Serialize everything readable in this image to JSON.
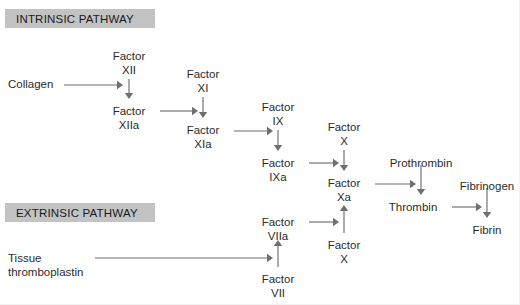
{
  "diagram": {
    "headers": [
      {
        "id": "intrinsic",
        "label": "INTRINSIC PATHWAY",
        "x": 5,
        "y": 9,
        "w": 150,
        "h": 19
      },
      {
        "id": "extrinsic",
        "label": "EXTRINSIC PATHWAY",
        "x": 5,
        "y": 203,
        "w": 150,
        "h": 19
      }
    ],
    "nodes": [
      {
        "id": "collagen",
        "lines": [
          "Collagen"
        ],
        "x": 8,
        "y": 78,
        "align": "left"
      },
      {
        "id": "factor-xii",
        "lines": [
          "Factor",
          "XII"
        ],
        "x": 129,
        "y": 50,
        "align": "center"
      },
      {
        "id": "factor-xiia",
        "lines": [
          "Factor",
          "XIIa"
        ],
        "x": 129,
        "y": 105,
        "align": "center"
      },
      {
        "id": "factor-xi",
        "lines": [
          "Factor",
          "XI"
        ],
        "x": 203,
        "y": 68,
        "align": "center"
      },
      {
        "id": "factor-xia",
        "lines": [
          "Factor",
          "XIa"
        ],
        "x": 203,
        "y": 124,
        "align": "center"
      },
      {
        "id": "factor-ix",
        "lines": [
          "Factor",
          "IX"
        ],
        "x": 278,
        "y": 101,
        "align": "center"
      },
      {
        "id": "factor-ixa",
        "lines": [
          "Factor",
          "IXa"
        ],
        "x": 278,
        "y": 157,
        "align": "center"
      },
      {
        "id": "factor-x-upper",
        "lines": [
          "Factor",
          "X"
        ],
        "x": 344,
        "y": 121,
        "align": "center"
      },
      {
        "id": "factor-xa",
        "lines": [
          "Factor",
          "Xa"
        ],
        "x": 344,
        "y": 177,
        "align": "center"
      },
      {
        "id": "factor-x-lower",
        "lines": [
          "Factor",
          "X"
        ],
        "x": 344,
        "y": 239,
        "align": "center"
      },
      {
        "id": "prothrombin",
        "lines": [
          "Prothrombin"
        ],
        "x": 421,
        "y": 157,
        "align": "center"
      },
      {
        "id": "thrombin",
        "lines": [
          "Thrombin"
        ],
        "x": 413,
        "y": 201,
        "align": "center"
      },
      {
        "id": "fibrinogen",
        "lines": [
          "Fibrinogen"
        ],
        "x": 487,
        "y": 180,
        "align": "center"
      },
      {
        "id": "fibrin",
        "lines": [
          "Fibrin"
        ],
        "x": 487,
        "y": 224,
        "align": "center"
      },
      {
        "id": "factor-viia",
        "lines": [
          "Factor",
          "VIIa"
        ],
        "x": 278,
        "y": 216,
        "align": "center"
      },
      {
        "id": "factor-vii",
        "lines": [
          "Factor",
          "VII"
        ],
        "x": 278,
        "y": 273,
        "align": "center"
      },
      {
        "id": "tissue-thromboplastin",
        "lines": [
          "Tissue",
          "thromboplastin"
        ],
        "x": 8,
        "y": 252,
        "align": "left"
      }
    ],
    "arrows": [
      {
        "id": "collagen-to-factor-xii",
        "from": "collagen",
        "to": "factor-xii",
        "direction": "right",
        "x1": 64,
        "y1": 85,
        "x2": 123,
        "y2": 85
      },
      {
        "id": "factor-xii-to-factor-xiia",
        "from": "factor-xii",
        "to": "factor-xiia",
        "direction": "down",
        "x1": 129,
        "y1": 79,
        "x2": 129,
        "y2": 99
      },
      {
        "id": "factor-xiia-to-factor-xi",
        "from": "factor-xiia",
        "to": "factor-xi",
        "direction": "right",
        "x1": 160,
        "y1": 111,
        "x2": 198,
        "y2": 111
      },
      {
        "id": "factor-xi-to-factor-xia",
        "from": "factor-xi",
        "to": "factor-xia",
        "direction": "down",
        "x1": 203,
        "y1": 97,
        "x2": 203,
        "y2": 118
      },
      {
        "id": "factor-xia-to-factor-ix",
        "from": "factor-xia",
        "to": "factor-ix",
        "direction": "right",
        "x1": 234,
        "y1": 131,
        "x2": 273,
        "y2": 131
      },
      {
        "id": "factor-ix-to-factor-ixa",
        "from": "factor-ix",
        "to": "factor-ixa",
        "direction": "down",
        "x1": 278,
        "y1": 130,
        "x2": 278,
        "y2": 151
      },
      {
        "id": "factor-ixa-to-factor-x-upper",
        "from": "factor-ixa",
        "to": "factor-x-upper",
        "direction": "right",
        "x1": 309,
        "y1": 163,
        "x2": 339,
        "y2": 163
      },
      {
        "id": "factor-x-upper-to-factor-xa",
        "from": "factor-x-upper",
        "to": "factor-xa",
        "direction": "down",
        "x1": 344,
        "y1": 150,
        "x2": 344,
        "y2": 171
      },
      {
        "id": "factor-x-lower-to-factor-xa",
        "from": "factor-x-lower",
        "to": "factor-xa",
        "direction": "up",
        "x1": 344,
        "y1": 233,
        "x2": 344,
        "y2": 205
      },
      {
        "id": "factor-xa-to-prothrombin",
        "from": "factor-xa",
        "to": "prothrombin",
        "direction": "right",
        "x1": 375,
        "y1": 184,
        "x2": 416,
        "y2": 184
      },
      {
        "id": "prothrombin-to-thrombin",
        "from": "prothrombin",
        "to": "thrombin",
        "direction": "down",
        "x1": 421,
        "y1": 165,
        "x2": 421,
        "y2": 195
      },
      {
        "id": "thrombin-to-fibrinogen",
        "from": "thrombin",
        "to": "fibrinogen",
        "direction": "right",
        "x1": 452,
        "y1": 207,
        "x2": 482,
        "y2": 207
      },
      {
        "id": "fibrinogen-to-fibrin",
        "from": "fibrinogen",
        "to": "fibrin",
        "direction": "down",
        "x1": 487,
        "y1": 188,
        "x2": 487,
        "y2": 218
      },
      {
        "id": "factor-vii-to-factor-viia",
        "from": "factor-vii",
        "to": "factor-viia",
        "direction": "up",
        "x1": 278,
        "y1": 267,
        "x2": 278,
        "y2": 240
      },
      {
        "id": "tissue-thromboplastin-to-factor-viia",
        "from": "tissue-thromboplastin",
        "to": "factor-viia",
        "direction": "right",
        "x1": 95,
        "y1": 258,
        "x2": 273,
        "y2": 258
      },
      {
        "id": "factor-viia-to-factor-x-lower",
        "from": "factor-viia",
        "to": "factor-x-lower",
        "direction": "right",
        "x1": 309,
        "y1": 222,
        "x2": 339,
        "y2": 222
      }
    ],
    "colors": {
      "header_bg": "#c3c3c3",
      "text": "#2b2b2b",
      "arrow": "#6f6f6f",
      "background": "#ffffff"
    }
  }
}
